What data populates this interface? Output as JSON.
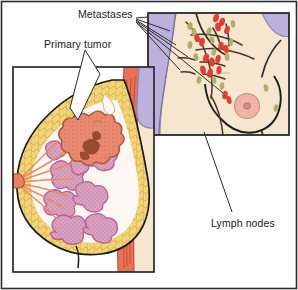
{
  "figure": {
    "width": 298,
    "height": 290,
    "background": "#ffffff",
    "border_color": "#2a2a2a"
  },
  "labels": {
    "metastases": "Metastases",
    "primary_tumor": "Primary tumor",
    "lymph_nodes": "Lymph nodes"
  },
  "colors": {
    "skin": "#f7e6cf",
    "skin_shadow": "#f0dcc0",
    "adipose_fat": "#f2d47a",
    "adipose_outline": "#c99b2e",
    "lobule": "#dba3c0",
    "lobule_outline": "#b5618f",
    "tumor": "#e88a72",
    "tumor_core": "#9c4a2e",
    "tumor_outline": "#b05a3c",
    "duct": "#e88a66",
    "muscle": "#e8715a",
    "muscle_line": "#c14a36",
    "bone_lavender": "#bcb0dd",
    "bone_outline": "#8d82b5",
    "metastasis_node": "#e04030",
    "lymph_node": "#a9b06b",
    "vessel": "#4a3328",
    "areola": "#f0b3a8",
    "nipple": "#e08b80",
    "outline": "#1b1b1b",
    "leader_line": "#2a2a2a",
    "panel_white": "#ffffff"
  },
  "panels": {
    "outer_border": {
      "x": 1,
      "y": 1,
      "width": 296,
      "height": 288
    },
    "main_cross_section": {
      "x": 12,
      "y": 66,
      "width": 143,
      "height": 207,
      "name": "breast-cross-section",
      "parts": [
        "adipose-tissue",
        "mammary-lobules",
        "lactiferous-ducts",
        "nipple",
        "primary-tumor",
        "chest-wall-muscle",
        "rib"
      ]
    },
    "inset_torso": {
      "x": 147,
      "y": 12,
      "width": 143,
      "height": 124,
      "name": "torso-inset",
      "parts": [
        "torso-skin",
        "breast-outline",
        "areola",
        "nipple",
        "lymphatic-vessels",
        "metastasis-markers",
        "lymph-node-markers"
      ]
    }
  },
  "legend_semantics": {
    "red_oval": "metastasis",
    "olive_oval": "lymph node",
    "dark_line": "lymphatic vessel"
  },
  "marker_counts": {
    "metastases_visible": 16,
    "lymph_nodes_visible": 15
  }
}
